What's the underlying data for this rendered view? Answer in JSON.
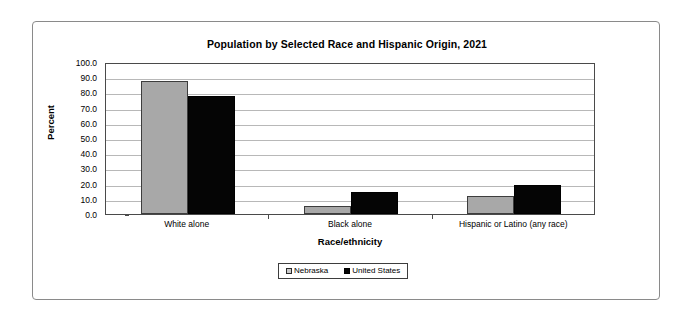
{
  "chart_data": {
    "type": "bar",
    "title": "Population by Selected Race and Hispanic Origin, 2021",
    "xlabel": "Race/ethnicity",
    "ylabel": "Percent",
    "ylim": [
      0,
      100
    ],
    "ytick_step": 10,
    "ytick_labels": [
      "100.0",
      "90.0",
      "80.0",
      "70.0",
      "60.0",
      "50.0",
      "40.0",
      "30.0",
      "20.0",
      "10.0",
      "0.0"
    ],
    "grid": true,
    "legend_position": "bottom-center",
    "categories": [
      "White alone",
      "Black alone",
      "Hispanic or Latino (any race)"
    ],
    "series": [
      {
        "name": "Nebraska",
        "color": "#a8a8a8",
        "values": [
          87.6,
          5.3,
          12.0
        ]
      },
      {
        "name": "United States",
        "color": "#050505",
        "values": [
          77.6,
          14.7,
          19.1
        ]
      }
    ]
  },
  "legend": {
    "items": [
      {
        "label": "Nebraska"
      },
      {
        "label": "United States"
      }
    ]
  }
}
